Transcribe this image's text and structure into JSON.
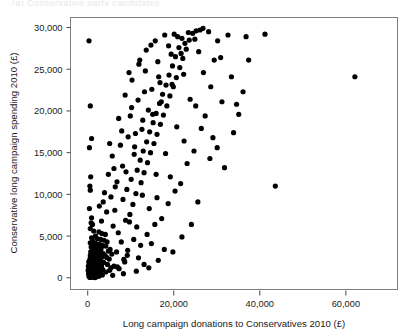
{
  "top_cut_text": "(a) Conservative party candidates",
  "chart_data": {
    "type": "scatter",
    "title": "",
    "xlabel": "Long campaign donations to Conservatives 2010 (£)",
    "ylabel": "Conservative long campaign spending 2010 (£)",
    "xlim": [
      -4000,
      72000
    ],
    "ylim": [
      -1400,
      31200
    ],
    "xticks": [
      0,
      20000,
      40000,
      60000
    ],
    "xticklabels": [
      "0",
      "20,000",
      "40,000",
      "60,000"
    ],
    "yticks": [
      0,
      5000,
      10000,
      15000,
      20000,
      25000,
      30000
    ],
    "yticklabels": [
      "0",
      "5,000",
      "10,000",
      "15,000",
      "20,000",
      "25,000",
      "30,000"
    ],
    "grid": false,
    "legend": null,
    "marker": "filled-circle",
    "marker_color": "#000000",
    "marker_size": 2.6,
    "points": [
      [
        300,
        28400
      ],
      [
        600,
        20600
      ],
      [
        900,
        16700
      ],
      [
        400,
        15600
      ],
      [
        700,
        12100
      ],
      [
        500,
        11000
      ],
      [
        600,
        10500
      ],
      [
        3900,
        10200
      ],
      [
        400,
        8300
      ],
      [
        900,
        7200
      ],
      [
        800,
        6600
      ],
      [
        1100,
        6400
      ],
      [
        600,
        5900
      ],
      [
        1400,
        5600
      ],
      [
        2600,
        5500
      ],
      [
        3300,
        5300
      ],
      [
        4100,
        5200
      ],
      [
        1800,
        5000
      ],
      [
        900,
        4800
      ],
      [
        2200,
        4700
      ],
      [
        3000,
        4600
      ],
      [
        3800,
        4500
      ],
      [
        1200,
        4400
      ],
      [
        4500,
        4300
      ],
      [
        600,
        4200
      ],
      [
        2000,
        4100
      ],
      [
        2800,
        4000
      ],
      [
        1500,
        3900
      ],
      [
        3500,
        3850
      ],
      [
        4200,
        3800
      ],
      [
        800,
        3700
      ],
      [
        1900,
        3600
      ],
      [
        2500,
        3500
      ],
      [
        3100,
        3450
      ],
      [
        5200,
        3400
      ],
      [
        1100,
        3300
      ],
      [
        2100,
        3250
      ],
      [
        4800,
        3200
      ],
      [
        700,
        3100
      ],
      [
        1600,
        3000
      ],
      [
        2900,
        2950
      ],
      [
        3600,
        2900
      ],
      [
        5600,
        2850
      ],
      [
        1000,
        2800
      ],
      [
        2300,
        2750
      ],
      [
        4000,
        2700
      ],
      [
        600,
        2650
      ],
      [
        1400,
        2600
      ],
      [
        2700,
        2550
      ],
      [
        3300,
        2500
      ],
      [
        4400,
        2450
      ],
      [
        900,
        2400
      ],
      [
        1800,
        2350
      ],
      [
        2400,
        2300
      ],
      [
        5000,
        2250
      ],
      [
        500,
        2200
      ],
      [
        1200,
        2150
      ],
      [
        2000,
        2100
      ],
      [
        3000,
        2050
      ],
      [
        700,
        2000
      ],
      [
        1500,
        1950
      ],
      [
        2600,
        1900
      ],
      [
        3700,
        1850
      ],
      [
        400,
        1800
      ],
      [
        1000,
        1750
      ],
      [
        1900,
        1700
      ],
      [
        2800,
        1650
      ],
      [
        4600,
        1600
      ],
      [
        600,
        1550
      ],
      [
        1300,
        1500
      ],
      [
        2200,
        1450
      ],
      [
        3200,
        1400
      ],
      [
        800,
        1350
      ],
      [
        1700,
        1300
      ],
      [
        2500,
        1250
      ],
      [
        5400,
        1200
      ],
      [
        300,
        1150
      ],
      [
        1100,
        1100
      ],
      [
        2000,
        1050
      ],
      [
        3500,
        1000
      ],
      [
        500,
        950
      ],
      [
        1400,
        900
      ],
      [
        2300,
        850
      ],
      [
        700,
        800
      ],
      [
        1600,
        750
      ],
      [
        2700,
        700
      ],
      [
        400,
        650
      ],
      [
        1200,
        600
      ],
      [
        2100,
        550
      ],
      [
        3000,
        500
      ],
      [
        600,
        450
      ],
      [
        1500,
        400
      ],
      [
        2400,
        350
      ],
      [
        900,
        300
      ],
      [
        1800,
        250
      ],
      [
        300,
        200
      ],
      [
        1000,
        150
      ],
      [
        2000,
        120
      ],
      [
        700,
        90
      ],
      [
        1300,
        60
      ],
      [
        500,
        40
      ],
      [
        1700,
        30
      ],
      [
        2600,
        200
      ],
      [
        3400,
        350
      ],
      [
        200,
        500
      ],
      [
        100,
        900
      ],
      [
        150,
        1400
      ],
      [
        250,
        1900
      ],
      [
        4200,
        700
      ],
      [
        5100,
        900
      ],
      [
        6100,
        1400
      ],
      [
        7300,
        1100
      ],
      [
        8400,
        2200
      ],
      [
        6700,
        3100
      ],
      [
        7800,
        4300
      ],
      [
        9200,
        2700
      ],
      [
        5900,
        6200
      ],
      [
        7100,
        5400
      ],
      [
        8800,
        6900
      ],
      [
        6300,
        8100
      ],
      [
        9800,
        7600
      ],
      [
        8200,
        9400
      ],
      [
        10500,
        8800
      ],
      [
        9100,
        10600
      ],
      [
        11200,
        10100
      ],
      [
        10100,
        11800
      ],
      [
        12400,
        11400
      ],
      [
        11500,
        12900
      ],
      [
        13100,
        12600
      ],
      [
        12200,
        14100
      ],
      [
        13900,
        13800
      ],
      [
        12900,
        15200
      ],
      [
        14600,
        15000
      ],
      [
        13700,
        16300
      ],
      [
        15400,
        16100
      ],
      [
        14400,
        17500
      ],
      [
        16100,
        17200
      ],
      [
        15200,
        18600
      ],
      [
        16900,
        18400
      ],
      [
        15900,
        19700
      ],
      [
        17600,
        19500
      ],
      [
        16700,
        20900
      ],
      [
        18400,
        20600
      ],
      [
        17400,
        22000
      ],
      [
        19100,
        21800
      ],
      [
        18200,
        23100
      ],
      [
        19900,
        22900
      ],
      [
        18900,
        24300
      ],
      [
        20600,
        24000
      ],
      [
        19700,
        25400
      ],
      [
        21400,
        25200
      ],
      [
        20400,
        26500
      ],
      [
        22100,
        26300
      ],
      [
        21200,
        27600
      ],
      [
        22900,
        27400
      ],
      [
        21900,
        28700
      ],
      [
        23600,
        28500
      ],
      [
        24400,
        29300
      ],
      [
        25200,
        29600
      ],
      [
        26100,
        29700
      ],
      [
        6800,
        11500
      ],
      [
        8100,
        13400
      ],
      [
        5400,
        9700
      ],
      [
        10800,
        14800
      ],
      [
        9400,
        16900
      ],
      [
        12800,
        18900
      ],
      [
        11700,
        21300
      ],
      [
        14900,
        22600
      ],
      [
        13400,
        24800
      ],
      [
        16300,
        25900
      ],
      [
        18800,
        27800
      ],
      [
        20900,
        28900
      ],
      [
        23400,
        29400
      ],
      [
        7600,
        15900
      ],
      [
        6100,
        13100
      ],
      [
        9900,
        19400
      ],
      [
        11100,
        17300
      ],
      [
        14100,
        20100
      ],
      [
        16800,
        23400
      ],
      [
        19400,
        26800
      ],
      [
        22600,
        28100
      ],
      [
        4800,
        12400
      ],
      [
        3600,
        9100
      ],
      [
        5100,
        16100
      ],
      [
        8700,
        21900
      ],
      [
        10300,
        23700
      ],
      [
        12100,
        26100
      ],
      [
        13600,
        27300
      ],
      [
        15700,
        28400
      ],
      [
        17900,
        29100
      ],
      [
        7200,
        19100
      ],
      [
        9600,
        24600
      ],
      [
        11900,
        25600
      ],
      [
        14700,
        27900
      ],
      [
        20100,
        29200
      ],
      [
        24900,
        28600
      ],
      [
        25800,
        27100
      ],
      [
        22300,
        24400
      ],
      [
        19600,
        23200
      ],
      [
        17100,
        21100
      ],
      [
        15100,
        19600
      ],
      [
        12600,
        17800
      ],
      [
        10900,
        15700
      ],
      [
        8900,
        12700
      ],
      [
        6400,
        10900
      ],
      [
        4400,
        7900
      ],
      [
        3200,
        6800
      ],
      [
        2700,
        8600
      ],
      [
        5700,
        14600
      ],
      [
        7900,
        17600
      ],
      [
        10200,
        20400
      ],
      [
        13200,
        22300
      ],
      [
        16500,
        24100
      ],
      [
        21700,
        26900
      ],
      [
        26800,
        29900
      ],
      [
        28100,
        29500
      ],
      [
        9300,
        3300
      ],
      [
        10700,
        4600
      ],
      [
        12300,
        3900
      ],
      [
        11400,
        6100
      ],
      [
        13800,
        5200
      ],
      [
        15600,
        6400
      ],
      [
        14300,
        8300
      ],
      [
        17200,
        7100
      ],
      [
        16100,
        9600
      ],
      [
        18700,
        8900
      ],
      [
        20300,
        10400
      ],
      [
        19200,
        12100
      ],
      [
        21600,
        11300
      ],
      [
        23100,
        13700
      ],
      [
        22400,
        16400
      ],
      [
        24700,
        15200
      ],
      [
        26400,
        17900
      ],
      [
        25100,
        20600
      ],
      [
        27300,
        19400
      ],
      [
        28600,
        22900
      ],
      [
        29400,
        26100
      ],
      [
        30200,
        28400
      ],
      [
        8600,
        1900
      ],
      [
        11800,
        2400
      ],
      [
        14800,
        4100
      ],
      [
        6900,
        1300
      ],
      [
        13100,
        1600
      ],
      [
        17800,
        3400
      ],
      [
        12700,
        9900
      ],
      [
        9700,
        6700
      ],
      [
        15900,
        12400
      ],
      [
        18100,
        14900
      ],
      [
        20700,
        18100
      ],
      [
        23800,
        21400
      ],
      [
        26900,
        24600
      ],
      [
        29100,
        16800
      ],
      [
        31200,
        21100
      ],
      [
        33400,
        24100
      ],
      [
        35100,
        19600
      ],
      [
        36800,
        28900
      ],
      [
        32600,
        29100
      ],
      [
        30900,
        26400
      ],
      [
        28400,
        14300
      ],
      [
        25600,
        9100
      ],
      [
        24100,
        6400
      ],
      [
        21900,
        4900
      ],
      [
        19800,
        3100
      ],
      [
        16400,
        2100
      ],
      [
        14200,
        1200
      ],
      [
        11300,
        800
      ],
      [
        8300,
        500
      ],
      [
        5800,
        300
      ],
      [
        41200,
        29200
      ],
      [
        62100,
        24100
      ],
      [
        43600,
        11000
      ],
      [
        36100,
        22300
      ],
      [
        33900,
        17400
      ],
      [
        31800,
        13200
      ],
      [
        37400,
        26100
      ],
      [
        34600,
        20800
      ],
      [
        30100,
        15600
      ]
    ]
  }
}
